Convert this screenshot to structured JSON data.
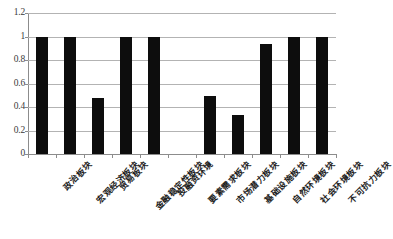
{
  "chart_data": {
    "type": "bar",
    "title": "",
    "subtitle": "",
    "xlabel": "",
    "ylabel": "",
    "ylim": [
      0,
      1.2
    ],
    "yticks": [
      "0",
      "0.2",
      "0.4",
      "0.6",
      "0.8",
      "1",
      "1.2"
    ],
    "ytick_values": [
      0,
      0.2,
      0.4,
      0.6,
      0.8,
      1,
      1.2
    ],
    "grid": true,
    "legend": "none",
    "bar_color": "#0d0d0d",
    "grid_color": "#b3b3b3",
    "axis_color": "#8c8c8c",
    "categories": [
      "政治板块",
      "宏观经济板块",
      "贸易板块",
      "金融稳定性板块",
      "投融资环境",
      "要素需求板块",
      "市场潜力板块",
      "基础设施板块",
      "自然环境板块",
      "社会环境板块",
      "不可抗力板块"
    ],
    "values": [
      1,
      1,
      0.48,
      1,
      1,
      0,
      0.49,
      0.33,
      0.94,
      1,
      1
    ]
  }
}
